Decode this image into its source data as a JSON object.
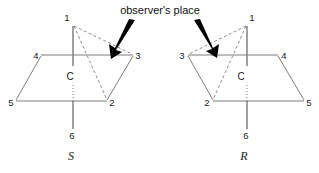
{
  "annotation": {
    "observer_label": "observer's place"
  },
  "figures": [
    {
      "id": "S",
      "caption": "S",
      "center_label": "C",
      "vertices": [
        {
          "label": "1",
          "x": 73,
          "y": 24,
          "label_x": 67,
          "label_y": 21
        },
        {
          "label": "2",
          "x": 107,
          "y": 101,
          "label_x": 110,
          "label_y": 105
        },
        {
          "label": "3",
          "x": 133,
          "y": 55,
          "label_x": 136,
          "label_y": 59
        },
        {
          "label": "4",
          "x": 41,
          "y": 55,
          "label_x": 33,
          "label_y": 59
        },
        {
          "label": "5",
          "x": 16,
          "y": 101,
          "label_x": 8,
          "label_y": 105
        },
        {
          "label": "6",
          "x": 73,
          "y": 130,
          "label_x": 69,
          "label_y": 138
        }
      ],
      "caption_x": 71,
      "caption_y": 159,
      "center_x": 70,
      "center_y": 80,
      "arrow": {
        "x1": 133,
        "y1": 21,
        "x2": 112,
        "y2": 58
      }
    },
    {
      "id": "R",
      "caption": "R",
      "center_label": "C",
      "vertices": [
        {
          "label": "1",
          "x": 247,
          "y": 24,
          "label_x": 250,
          "label_y": 21
        },
        {
          "label": "2",
          "x": 213,
          "y": 101,
          "label_x": 205,
          "label_y": 105
        },
        {
          "label": "3",
          "x": 188,
          "y": 55,
          "label_x": 179,
          "label_y": 59
        },
        {
          "label": "4",
          "x": 278,
          "y": 55,
          "label_x": 281,
          "label_y": 59
        },
        {
          "label": "5",
          "x": 304,
          "y": 101,
          "label_x": 307,
          "label_y": 105
        },
        {
          "label": "6",
          "x": 247,
          "y": 130,
          "label_x": 243,
          "label_y": 138
        }
      ],
      "caption_x": 244,
      "caption_y": 159,
      "center_x": 241,
      "center_y": 80,
      "arrow": {
        "x1": 196,
        "y1": 21,
        "x2": 216,
        "y2": 56
      }
    }
  ],
  "colors": {
    "background": "#ffffff",
    "edge": "#7d7d7d",
    "dashed_edge": "#8d8d8d",
    "axis": "#8a8a8a",
    "arrow": "#000000",
    "text": "#111111"
  }
}
